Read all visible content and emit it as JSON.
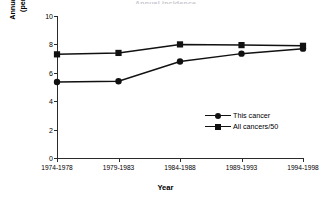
{
  "figure": {
    "title_sliver": "Annual incidence",
    "background_color": "#ffffff",
    "ink_color": "#111111"
  },
  "chart_data": {
    "type": "line",
    "title": "",
    "xlabel": "Year",
    "ylabel": "Annual incidence\n(per 100,000)",
    "categories": [
      "1974-1978",
      "1979-1983",
      "1984-1988",
      "1989-1993",
      "1994-1998"
    ],
    "ylim": [
      0,
      10
    ],
    "yticks": [
      0,
      2,
      4,
      6,
      8,
      10
    ],
    "ytick_labels": [
      "0",
      "2",
      "4",
      "6",
      "8",
      "10"
    ],
    "grid": false,
    "legend_position": "center-right",
    "series": [
      {
        "name": "This cancer",
        "marker": "circle",
        "color": "#111111",
        "values": [
          5.35,
          5.4,
          6.8,
          7.35,
          7.7
        ]
      },
      {
        "name": "All cancers/50",
        "marker": "square",
        "color": "#111111",
        "values": [
          7.3,
          7.4,
          8.0,
          7.95,
          7.9
        ]
      }
    ]
  }
}
